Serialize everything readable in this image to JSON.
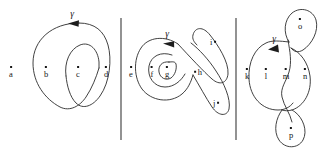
{
  "figure": {
    "type": "mathematical-diagram",
    "background_color": "#ffffff",
    "stroke_color": "#2b2b2b",
    "label_color": "#161616",
    "panels": [
      {
        "id": "panel-left",
        "curve_label": "γ",
        "point_labels": [
          "a",
          "b",
          "c",
          "d"
        ]
      },
      {
        "id": "panel-middle",
        "curve_label": "γ",
        "point_labels": [
          "e",
          "f",
          "g",
          "h",
          "i",
          "j"
        ]
      },
      {
        "id": "panel-right",
        "curve_label": "γ",
        "point_labels": [
          "k",
          "l",
          "m",
          "n",
          "o",
          "p"
        ]
      }
    ],
    "labels": {
      "a": "a",
      "b": "b",
      "c": "c",
      "d": "d",
      "e": "e",
      "f": "f",
      "g": "g",
      "h": "h",
      "i": "i",
      "j": "j",
      "k": "k",
      "l": "l",
      "m": "m",
      "n": "n",
      "o": "o",
      "p": "p"
    },
    "gamma": {
      "left": "γ",
      "middle": "γ",
      "right": "γ"
    },
    "dividers": 2
  }
}
